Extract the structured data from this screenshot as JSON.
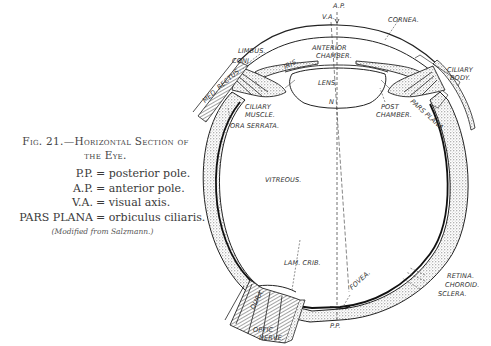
{
  "figure": {
    "number_label": "Fig. 21.",
    "title_line1": "Fig. 21.—Horizontal Section of",
    "title_line2": "the Eye.",
    "legend": [
      {
        "abbr": "P.P.",
        "def": "= posterior pole."
      },
      {
        "abbr": "A.P.",
        "def": "= anterior pole."
      },
      {
        "abbr": "V.A.",
        "def": "= visual axis."
      },
      {
        "abbr": "PARS PLANA",
        "def": "= orbiculus ciliaris."
      }
    ],
    "credit": "(Modified from Salzmann.)"
  },
  "diagram": {
    "labels": {
      "ap": "A.P.",
      "va": "V.A.",
      "cornea": "CORNEA.",
      "limbus": "LIMBUS.",
      "conj": "CONJ.",
      "anterior_chamber_1": "ANTERIOR",
      "anterior_chamber_2": "CHAMBER.",
      "iris": "IRIS.",
      "med_rectus": "MED. RECTUS.",
      "lens": "LENS.",
      "n": "N",
      "ciliary_body_1": "CILIARY",
      "ciliary_body_2": "BODY.",
      "ciliary_muscle_1": "CILIARY",
      "ciliary_muscle_2": "MUSCLE.",
      "ora_serrata": "ORA SERRATA.",
      "post_chamber_1": "POST",
      "post_chamber_2": "CHAMBER.",
      "pars_plana": "PARS PLANA.",
      "vitreous": "VITREOUS.",
      "lam_crib": "LAM. CRIB.",
      "fovea": "FOVEA.",
      "dura": "DURA.",
      "optic_nerve_1": "OPTIC",
      "optic_nerve_2": "NERVE.",
      "pp": "P.P.",
      "retina": "RETINA.",
      "choroid": "CHOROID.",
      "sclera": "SCLERA."
    },
    "colors": {
      "ink": "#222222",
      "stipple": "#bdbdbd",
      "paper": "#ffffff"
    }
  }
}
